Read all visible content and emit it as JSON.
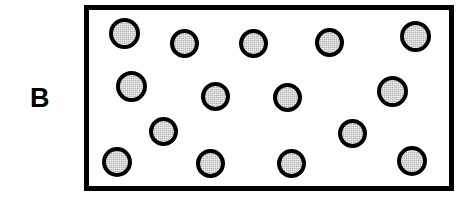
{
  "figure": {
    "panel_label": "B",
    "panel_label_x": 30,
    "panel_label_y": 85,
    "background_color": "#ffffff"
  },
  "chamber": {
    "name": "chamber-box",
    "x": 84,
    "y": 5,
    "width": 370,
    "height": 186,
    "border_width": 5,
    "border_color": "#000000",
    "fill_color": "#ffffff"
  },
  "particle_style": {
    "fill_color": "#b3b3b3",
    "outline_color": "#000000",
    "outline_width": 4,
    "texture": "stippled-gray"
  },
  "particles": [
    {
      "id": 1,
      "cx": 124,
      "cy": 33,
      "d": 31
    },
    {
      "id": 2,
      "cx": 184,
      "cy": 43,
      "d": 29
    },
    {
      "id": 3,
      "cx": 253,
      "cy": 43,
      "d": 29
    },
    {
      "id": 4,
      "cx": 329,
      "cy": 42,
      "d": 29
    },
    {
      "id": 5,
      "cx": 415,
      "cy": 36,
      "d": 31
    },
    {
      "id": 6,
      "cx": 131,
      "cy": 86,
      "d": 31
    },
    {
      "id": 7,
      "cx": 215,
      "cy": 96,
      "d": 29
    },
    {
      "id": 8,
      "cx": 287,
      "cy": 97,
      "d": 29
    },
    {
      "id": 9,
      "cx": 392,
      "cy": 91,
      "d": 31
    },
    {
      "id": 10,
      "cx": 163,
      "cy": 131,
      "d": 29
    },
    {
      "id": 11,
      "cx": 352,
      "cy": 133,
      "d": 29
    },
    {
      "id": 12,
      "cx": 117,
      "cy": 162,
      "d": 30
    },
    {
      "id": 13,
      "cx": 210,
      "cy": 163,
      "d": 29
    },
    {
      "id": 14,
      "cx": 291,
      "cy": 163,
      "d": 29
    },
    {
      "id": 15,
      "cx": 412,
      "cy": 161,
      "d": 30
    }
  ],
  "particle_count": 15
}
